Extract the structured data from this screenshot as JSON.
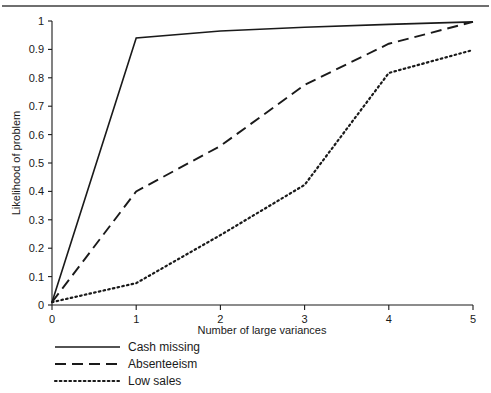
{
  "figure": {
    "has_top_rule": true,
    "background_color": "#ffffff",
    "ink_color": "#1a1a1a"
  },
  "chart_data": {
    "type": "line",
    "title": "",
    "subtitle": "",
    "xlabel": "Number of large variances",
    "ylabel": "Likelihood of problem",
    "xlim": [
      0,
      5
    ],
    "ylim": [
      0,
      1
    ],
    "grid": false,
    "legend_position": "below-left",
    "x": [
      0,
      1,
      2,
      3,
      4,
      5
    ],
    "xticks": [
      "0",
      "1",
      "2",
      "3",
      "4",
      "5"
    ],
    "yticks": [
      "0",
      "0.1",
      "0.2",
      "0.3",
      "0.4",
      "0.5",
      "0.6",
      "0.7",
      "0.8",
      "0.9",
      "1"
    ],
    "ytick_values": [
      0,
      0.1,
      0.2,
      0.3,
      0.4,
      0.5,
      0.6,
      0.7,
      0.8,
      0.9,
      1
    ],
    "series": [
      {
        "name": "Cash missing",
        "style": "solid",
        "color": "#1a1a1a",
        "values": [
          0.01,
          0.94,
          0.965,
          0.978,
          0.988,
          0.997
        ]
      },
      {
        "name": "Absenteeism",
        "style": "dashed",
        "color": "#1a1a1a",
        "values": [
          0.01,
          0.4,
          0.56,
          0.775,
          0.92,
          0.997
        ]
      },
      {
        "name": "Low sales",
        "style": "dotted",
        "color": "#1a1a1a",
        "values": [
          0.01,
          0.077,
          0.246,
          0.423,
          0.817,
          0.898
        ]
      }
    ]
  },
  "legend": {
    "entries": [
      {
        "label": "Cash missing",
        "style": "solid"
      },
      {
        "label": "Absenteeism",
        "style": "dashed"
      },
      {
        "label": "Low sales",
        "style": "dotted"
      }
    ]
  }
}
